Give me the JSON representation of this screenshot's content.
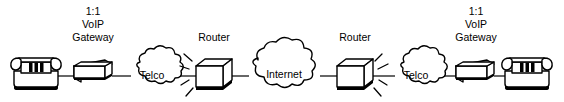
{
  "diagram": {
    "background_color": "#ffffff",
    "line_color": "#000000",
    "width": 564,
    "height": 102,
    "baseline_y": 76,
    "nodes": [
      {
        "id": "phone-left",
        "type": "telephone-icon",
        "label": "",
        "x": 36,
        "y": 74
      },
      {
        "id": "gateway-left",
        "type": "box-3d",
        "label": "1:1\nVoIP\nGateway",
        "label_lines": [
          "1:1",
          "VoIP",
          "Gateway"
        ],
        "x": 91,
        "y": 73
      },
      {
        "id": "telco-left",
        "type": "cloud",
        "label": "Telco",
        "x": 152,
        "y": 72
      },
      {
        "id": "router-left",
        "type": "cube-3d",
        "label": "Router",
        "x": 214,
        "y": 72
      },
      {
        "id": "internet",
        "type": "cloud",
        "label": "Internet",
        "x": 284,
        "y": 70
      },
      {
        "id": "router-right",
        "type": "cube-3d",
        "label": "Router",
        "x": 355,
        "y": 72
      },
      {
        "id": "telco-right",
        "type": "cloud",
        "label": "Telco",
        "x": 416,
        "y": 72
      },
      {
        "id": "gateway-right",
        "type": "box-3d",
        "label": "1:1\nVoIP\nGateway",
        "label_lines": [
          "1:1",
          "VoIP",
          "Gateway"
        ],
        "x": 473,
        "y": 73
      },
      {
        "id": "phone-right",
        "type": "telephone-icon",
        "label": "",
        "x": 527,
        "y": 74
      }
    ],
    "labels": {
      "gateway_left_line1": "1:1",
      "gateway_left_line2": "VoIP",
      "gateway_left_line3": "Gateway",
      "telco_left": "Telco",
      "router_left": "Router",
      "internet": "Internet",
      "router_right": "Router",
      "telco_right": "Telco",
      "gateway_right_line1": "1:1",
      "gateway_right_line2": "VoIP",
      "gateway_right_line3": "Gateway"
    }
  }
}
